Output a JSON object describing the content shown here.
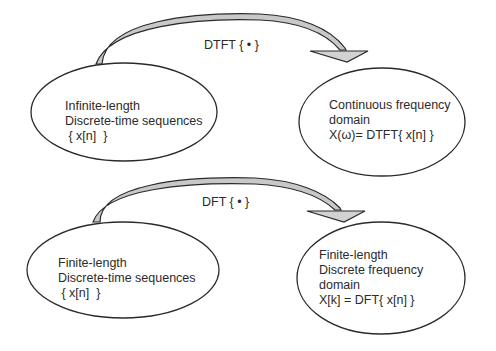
{
  "diagram": {
    "top": {
      "arrow_label": "DTFT { • }",
      "source": {
        "lines": [
          "Infinite-length",
          "Discrete-time sequences",
          " { x[n]  }"
        ]
      },
      "target": {
        "lines": [
          "Continuous frequency",
          "domain",
          "X(ω)= DTFT{ x[n] }"
        ]
      }
    },
    "bottom": {
      "arrow_label": "DFT { • }",
      "source": {
        "lines": [
          "Finite-length",
          "Discrete-time sequences",
          " { x[n]  }"
        ]
      },
      "target": {
        "lines": [
          "Finite-length",
          "Discrete frequency",
          "domain",
          "X[k] = DFT{ x[n] }"
        ]
      }
    },
    "colors": {
      "stroke": "#2a2a2a",
      "arrow_fill": "#c8c8c8",
      "background": "#ffffff"
    }
  }
}
